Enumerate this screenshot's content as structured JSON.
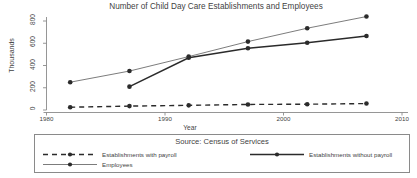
{
  "chart_data": {
    "type": "line",
    "title": "Number of Child Day Care Establishments and Employees",
    "xlabel": "Year",
    "ylabel": "Thousands",
    "source": "Source: Census of Services",
    "xlim": [
      1980,
      2010
    ],
    "ylim": [
      0,
      860
    ],
    "xticks": [
      1980,
      1990,
      2000,
      2010
    ],
    "yticks": [
      0,
      200,
      400,
      600,
      800
    ],
    "grid": false,
    "legend_position": "bottom",
    "x": [
      1982,
      1987,
      1992,
      1997,
      2002,
      2007
    ],
    "series": [
      {
        "name": "Establishments with payroll",
        "style": "dashed",
        "color": "#2b2b2b",
        "x": [
          1982,
          1987,
          1992,
          1997,
          2002,
          2007
        ],
        "values": [
          25,
          35,
          42,
          50,
          52,
          58
        ]
      },
      {
        "name": "Establishments without payroll",
        "style": "solid-thick",
        "color": "#2b2b2b",
        "x": [
          1987,
          1992,
          1997,
          2002,
          2007
        ],
        "values": [
          210,
          470,
          555,
          605,
          665
        ]
      },
      {
        "name": "Employees",
        "style": "solid-thin",
        "color": "#5a5a5a",
        "x": [
          1982,
          1987,
          1992,
          1997,
          2002,
          2007
        ],
        "values": [
          250,
          350,
          480,
          615,
          735,
          840
        ]
      }
    ]
  },
  "axis": {
    "y_tick_labels": [
      "0",
      "200",
      "400",
      "600",
      "800"
    ],
    "x_tick_labels": [
      "1980",
      "1990",
      "2000",
      "2010"
    ]
  },
  "legend": {
    "source_label": "Source: Census of Services",
    "entries": [
      {
        "label": "Establishments with payroll"
      },
      {
        "label": "Establishments without payroll"
      },
      {
        "label": "Employees"
      }
    ]
  }
}
